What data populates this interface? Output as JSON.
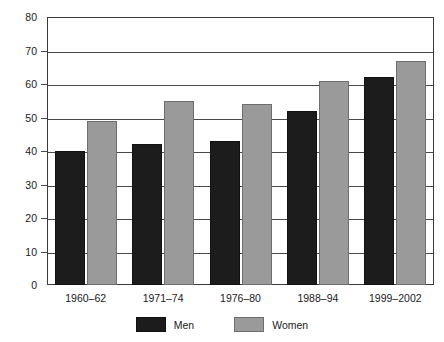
{
  "chart_data": {
    "type": "bar",
    "title": "",
    "xlabel": "",
    "ylabel": "Prevalence of Overweight (%)",
    "categories": [
      "1960–62",
      "1971–74",
      "1976–80",
      "1988–94",
      "1999–2002"
    ],
    "series": [
      {
        "name": "Men",
        "color": "#1c1c1c",
        "values": [
          40,
          42,
          43,
          52,
          62
        ]
      },
      {
        "name": "Women",
        "color": "#9a9a9a",
        "values": [
          49,
          55,
          54,
          61,
          67
        ]
      }
    ],
    "ylim": [
      0,
      80
    ],
    "ytick_step": 10,
    "yticks": [
      80,
      70,
      60,
      50,
      40,
      30,
      20,
      10,
      0
    ],
    "ytick_labels": [
      "80",
      "70",
      "60",
      "50",
      "40",
      "30",
      "20",
      "10",
      "0"
    ],
    "grid": true,
    "grid_axis": "y",
    "legend_position": "bottom",
    "legend_entries": [
      "Men",
      "Women"
    ]
  }
}
